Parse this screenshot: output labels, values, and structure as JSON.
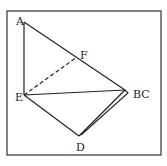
{
  "diagram": {
    "frame": {
      "x": 7,
      "y": 11,
      "width": 154,
      "height": 144
    },
    "colors": {
      "line": "#222222",
      "frame": "#333333",
      "background": "#ffffff"
    },
    "points": [
      {
        "id": "A",
        "label": "A",
        "x": 24,
        "y": 22,
        "lx": 16,
        "ly": 25
      },
      {
        "id": "F",
        "label": "F",
        "x": 77,
        "y": 57,
        "lx": 80,
        "ly": 59
      },
      {
        "id": "E",
        "label": "E",
        "x": 24,
        "y": 95,
        "lx": 15,
        "ly": 101
      },
      {
        "id": "BC",
        "label": "BC",
        "x": 125,
        "y": 90,
        "lx": 133,
        "ly": 98
      },
      {
        "id": "D",
        "label": "D",
        "x": 79,
        "y": 136,
        "lx": 76,
        "ly": 151
      }
    ],
    "segments": [
      {
        "from": "A",
        "to": "E",
        "style": "solid"
      },
      {
        "from": "A",
        "to": "BC",
        "style": "solid"
      },
      {
        "from": "E",
        "to": "BC",
        "style": "solid"
      },
      {
        "from": "E",
        "to": "D",
        "style": "solid"
      },
      {
        "from": "D",
        "to": "BC",
        "style": "solid"
      },
      {
        "from": "E",
        "to": "F",
        "style": "dashed"
      }
    ]
  }
}
